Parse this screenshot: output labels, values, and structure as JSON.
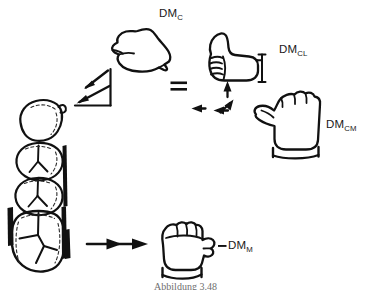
{
  "figure": {
    "type": "anatomical-line-drawing",
    "background_color": "#ffffff",
    "ink_color": "#111111",
    "caption": "Abbildung 3.48"
  },
  "labels": {
    "dm_c": {
      "base": "DM",
      "sub": "C"
    },
    "dm_cl": {
      "base": "DM",
      "sub": "CL"
    },
    "dm_cm": {
      "base": "DM",
      "sub": "CM"
    },
    "dm_m": {
      "base": "DM",
      "sub": "M"
    },
    "dash_before_dm_m": "–"
  },
  "symbols": {
    "equals": "=",
    "arrow_up": "arrow-up",
    "arrow_left": "arrow-left",
    "arrow_bent_left_up": "arrow-bent-left-up",
    "arrow_right_1": "arrow-right",
    "arrow_right_2": "arrow-right",
    "arrow_downleft_1": "arrow-down-left",
    "arrow_downleft_2": "arrow-down-left"
  },
  "tooth_stack": {
    "name": "molar-row-occlusal-view",
    "count": 4,
    "items": [
      {
        "index": 1,
        "type": "premolar-crown"
      },
      {
        "index": 2,
        "type": "molar-crown"
      },
      {
        "index": 3,
        "type": "molar-crown"
      },
      {
        "index": 4,
        "type": "molar-crown-large"
      }
    ],
    "side_bar": "enamel-band-marker"
  },
  "hands": [
    {
      "name": "hand-dm-c",
      "pose": "flat-hand-pointing-right",
      "label": "DM_C"
    },
    {
      "name": "hand-dm-cl",
      "pose": "thumbs-up-fist",
      "label": "DM_CL"
    },
    {
      "name": "hand-dm-cm",
      "pose": "fist-thumb-left",
      "label": "DM_CM"
    },
    {
      "name": "hand-dm-m",
      "pose": "fist-thumb-right",
      "label": "DM_M"
    }
  ]
}
